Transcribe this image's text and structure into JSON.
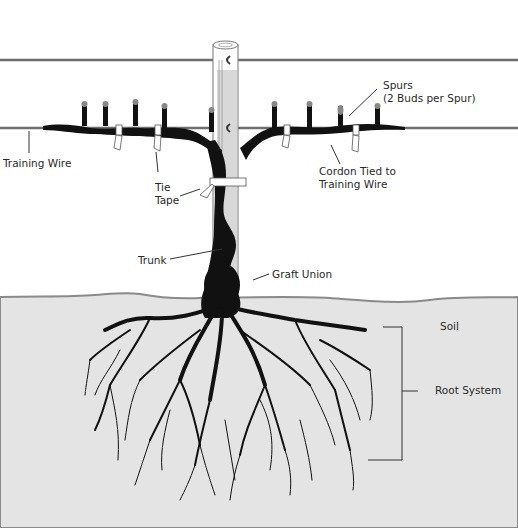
{
  "diagram": {
    "colors": {
      "background": "#ffffff",
      "soil": "#e4e4e4",
      "soil_line": "#8a8a8a",
      "wire": "#6e6e6e",
      "vine": "#111111",
      "leader_line": "#333333",
      "text": "#2a2a2a"
    },
    "labels": {
      "training_wire": "Training Wire",
      "spurs_line1": "Spurs",
      "spurs_line2": "(2 Buds per Spur)",
      "cordon_line1": "Cordon Tied to",
      "cordon_line2": "Training Wire",
      "tie_line1": "Tie",
      "tie_line2": "Tape",
      "trunk": "Trunk",
      "graft_union": "Graft Union",
      "soil": "Soil",
      "root_system": "Root System"
    },
    "components": [
      "top-wire",
      "training-wire",
      "stake",
      "cordon",
      "spurs",
      "tie-tapes",
      "trunk",
      "graft-union",
      "soil",
      "root-system"
    ]
  }
}
